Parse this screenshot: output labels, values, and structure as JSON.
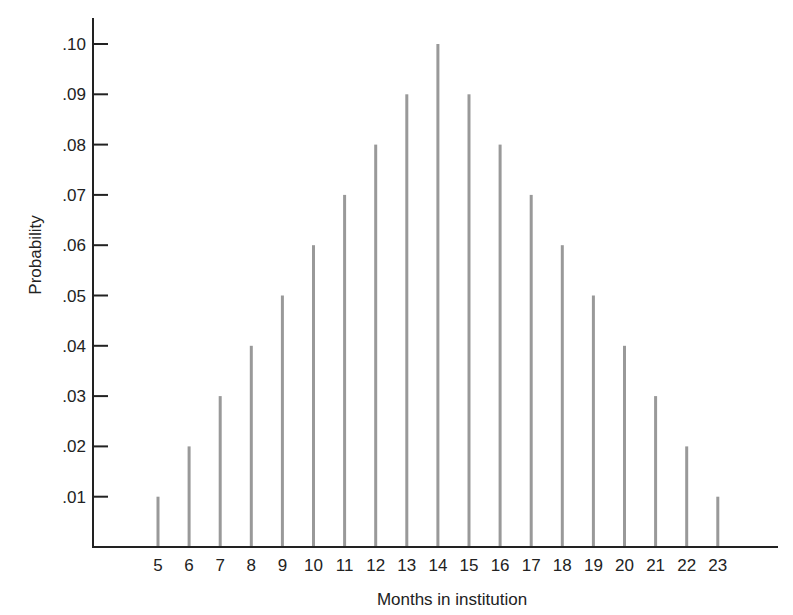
{
  "chart_data": {
    "type": "bar",
    "style": "spike",
    "title": "",
    "xlabel": "Months in institution",
    "ylabel": "Probability",
    "categories": [
      "5",
      "6",
      "7",
      "8",
      "9",
      "10",
      "11",
      "12",
      "13",
      "14",
      "15",
      "16",
      "17",
      "18",
      "19",
      "20",
      "21",
      "22",
      "23"
    ],
    "values": [
      0.01,
      0.02,
      0.03,
      0.04,
      0.05,
      0.06,
      0.07,
      0.08,
      0.09,
      0.1,
      0.09,
      0.08,
      0.07,
      0.06,
      0.05,
      0.04,
      0.03,
      0.02,
      0.01
    ],
    "yticks": [
      0.01,
      0.02,
      0.03,
      0.04,
      0.05,
      0.06,
      0.07,
      0.08,
      0.09,
      0.1
    ],
    "ytick_labels": [
      ".01",
      ".02",
      ".03",
      ".04",
      ".05",
      ".06",
      ".07",
      ".08",
      ".09",
      ".10"
    ],
    "ylim": [
      0,
      0.105
    ],
    "grid": false,
    "legend": null,
    "bar_color": "#999999",
    "axis_color": "#222222"
  }
}
